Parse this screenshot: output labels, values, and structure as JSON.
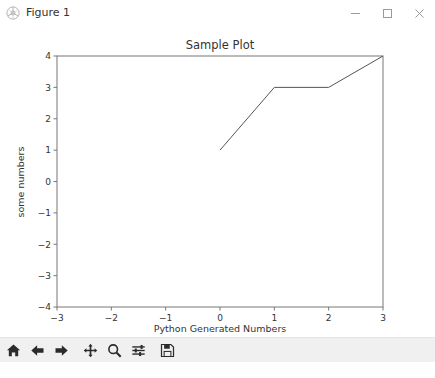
{
  "window": {
    "title": "Figure 1",
    "icon": "matplotlib-icon",
    "controls": {
      "minimize_label": "Minimize",
      "maximize_label": "Maximize",
      "close_label": "Close"
    }
  },
  "toolbar": {
    "buttons": [
      {
        "name": "home-button",
        "icon": "home-icon",
        "tooltip": "Reset original view"
      },
      {
        "name": "back-button",
        "icon": "arrow-left-icon",
        "tooltip": "Back to previous view"
      },
      {
        "name": "forward-button",
        "icon": "arrow-right-icon",
        "tooltip": "Forward to next view"
      },
      {
        "name": "pan-button",
        "icon": "move-icon",
        "tooltip": "Pan axes with left mouse, zoom with right"
      },
      {
        "name": "zoom-button",
        "icon": "magnifier-icon",
        "tooltip": "Zoom to rectangle"
      },
      {
        "name": "subplots-button",
        "icon": "sliders-icon",
        "tooltip": "Configure subplots"
      },
      {
        "name": "save-button",
        "icon": "floppy-disk-icon",
        "tooltip": "Save the figure"
      }
    ]
  },
  "statusbar": {
    "text": ""
  },
  "chart_data": {
    "type": "line",
    "title": "Sample Plot",
    "xlabel": "Python Generated Numbers",
    "ylabel": "some numbers",
    "x": [
      0,
      1,
      2,
      3
    ],
    "y": [
      1,
      3,
      3,
      4
    ],
    "xlim": [
      -3,
      3
    ],
    "ylim": [
      -4,
      4
    ],
    "xticks": [
      -3,
      -2,
      -1,
      0,
      1,
      2,
      3
    ],
    "xticklabels": [
      "−3",
      "−2",
      "−1",
      "0",
      "1",
      "2",
      "3"
    ],
    "yticks": [
      -4,
      -3,
      -2,
      -1,
      0,
      1,
      2,
      3,
      4
    ],
    "yticklabels": [
      "−4",
      "−3",
      "−2",
      "−1",
      "0",
      "1",
      "2",
      "3",
      "4"
    ],
    "grid": false,
    "legend": null,
    "line_color": "#555555",
    "line_width": 1,
    "axes_color": "#777777",
    "text_color": "#333333",
    "background": "#ffffff"
  }
}
